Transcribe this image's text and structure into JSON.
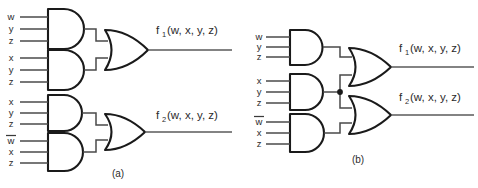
{
  "figure": {
    "background_color": "#ffffff",
    "line_color": "#1a1a1a",
    "wire_color": "#4a4a4a",
    "panels": [
      {
        "id": "a",
        "caption": "(a)",
        "and_gates": [
          {
            "id": "a-and-1",
            "inputs": [
              {
                "label": "w",
                "overbar": false
              },
              {
                "label": "y",
                "overbar": false
              },
              {
                "label": "z",
                "overbar": false
              }
            ]
          },
          {
            "id": "a-and-2",
            "inputs": [
              {
                "label": "x",
                "overbar": false
              },
              {
                "label": "y",
                "overbar": false
              },
              {
                "label": "z",
                "overbar": false
              }
            ]
          },
          {
            "id": "a-and-3",
            "inputs": [
              {
                "label": "x",
                "overbar": false
              },
              {
                "label": "y",
                "overbar": false
              },
              {
                "label": "z",
                "overbar": false
              }
            ]
          },
          {
            "id": "a-and-4",
            "inputs": [
              {
                "label": "w",
                "overbar": true
              },
              {
                "label": "x",
                "overbar": false
              },
              {
                "label": "z",
                "overbar": false
              }
            ]
          }
        ],
        "or_gates": [
          {
            "id": "a-or-1",
            "output": {
              "name": "f",
              "sub": "1",
              "args": "(w, x, y, z)"
            }
          },
          {
            "id": "a-or-2",
            "output": {
              "name": "f",
              "sub": "2",
              "args": "(w, x, y, z)"
            }
          }
        ],
        "junctions": 0
      },
      {
        "id": "b",
        "caption": "(b)",
        "and_gates": [
          {
            "id": "b-and-1",
            "inputs": [
              {
                "label": "w",
                "overbar": false
              },
              {
                "label": "y",
                "overbar": false
              },
              {
                "label": "z",
                "overbar": false
              }
            ]
          },
          {
            "id": "b-and-2",
            "inputs": [
              {
                "label": "x",
                "overbar": false
              },
              {
                "label": "y",
                "overbar": false
              },
              {
                "label": "z",
                "overbar": false
              }
            ]
          },
          {
            "id": "b-and-3",
            "inputs": [
              {
                "label": "w",
                "overbar": true
              },
              {
                "label": "x",
                "overbar": false
              },
              {
                "label": "z",
                "overbar": false
              }
            ]
          }
        ],
        "or_gates": [
          {
            "id": "b-or-1",
            "output": {
              "name": "f",
              "sub": "1",
              "args": "(w, x, y, z)"
            }
          },
          {
            "id": "b-or-2",
            "output": {
              "name": "f",
              "sub": "2",
              "args": "(w, x, y, z)"
            }
          }
        ],
        "junctions": 1
      }
    ]
  },
  "labels": {
    "a_g1_i1": "w",
    "a_g1_i2": "y",
    "a_g1_i3": "z",
    "a_g2_i1": "x",
    "a_g2_i2": "y",
    "a_g2_i3": "z",
    "a_g3_i1": "x",
    "a_g3_i2": "y",
    "a_g3_i3": "z",
    "a_g4_i1": "w",
    "a_g4_i2": "x",
    "a_g4_i3": "z",
    "b_g1_i1": "w",
    "b_g1_i2": "y",
    "b_g1_i3": "z",
    "b_g2_i1": "x",
    "b_g2_i2": "y",
    "b_g2_i3": "z",
    "b_g3_i1": "w",
    "b_g3_i2": "x",
    "b_g3_i3": "z",
    "f1_name": "f",
    "f1_sub": "1",
    "f1_args": "(w, x, y, z)",
    "f2_name": "f",
    "f2_sub": "2",
    "f2_args": "(w, x, y, z)",
    "caption_a": "(a)",
    "caption_b": "(b)"
  }
}
